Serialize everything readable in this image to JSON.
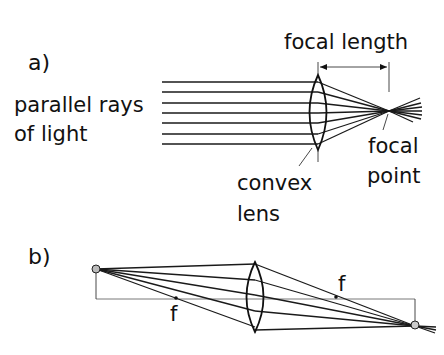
{
  "panel_a": {
    "label": "a)",
    "rays_label_line1": "parallel rays",
    "rays_label_line2": "of light",
    "focal_length_label": "focal length",
    "focal_point_line1": "focal",
    "focal_point_line2": "point",
    "lens_label_line1": "convex",
    "lens_label_line2": "lens"
  },
  "panel_b": {
    "label": "b)",
    "focus_left_label": "f",
    "focus_right_label": "f"
  },
  "colors": {
    "ink": "#111111",
    "background": "#ffffff",
    "object_dot": "#bbbbbb"
  }
}
